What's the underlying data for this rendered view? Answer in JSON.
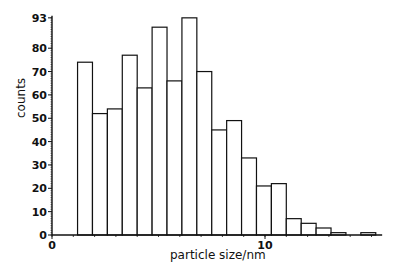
{
  "chart_data": {
    "type": "bar",
    "title": "",
    "xlabel": "particle size/nm",
    "ylabel": "counts",
    "ylim": [
      0,
      93
    ],
    "xlim": [
      0,
      15.5
    ],
    "y_ticks": [
      0,
      10,
      20,
      30,
      40,
      50,
      60,
      70,
      80,
      93
    ],
    "x_ticks": [
      0,
      10
    ],
    "bin_width": 0.7,
    "bins_start": [
      1.2,
      1.9,
      2.6,
      3.3,
      4.0,
      4.7,
      5.4,
      6.1,
      6.8,
      7.5,
      8.2,
      8.9,
      9.6,
      10.3,
      11.0,
      11.7,
      12.4,
      13.1,
      13.8,
      14.5
    ],
    "values": [
      74,
      52,
      54,
      77,
      63,
      89,
      66,
      93,
      70,
      45,
      49,
      33,
      21,
      22,
      7,
      5,
      3,
      1,
      0,
      1
    ],
    "grid": false,
    "legend": null
  },
  "axes": {
    "xlabel": "particle size/nm",
    "ylabel": "counts"
  }
}
